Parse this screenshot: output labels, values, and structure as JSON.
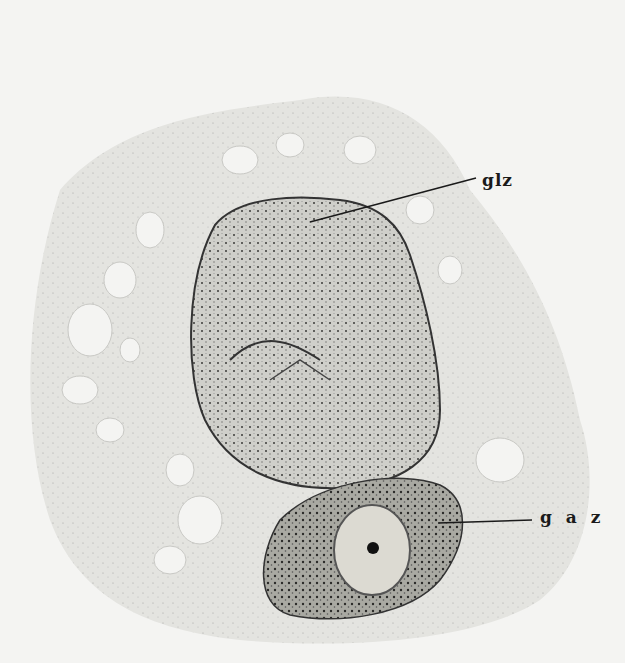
{
  "figure": {
    "type": "histological illustration",
    "labels": [
      {
        "id": "glz",
        "text": "glz"
      },
      {
        "id": "gaz",
        "text": "g a z"
      }
    ]
  }
}
